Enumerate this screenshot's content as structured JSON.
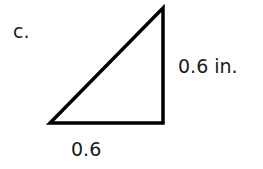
{
  "problem": {
    "label": "c."
  },
  "triangle": {
    "type": "right-triangle",
    "vertices": {
      "bottom_left": [
        50,
        123
      ],
      "bottom_right": [
        163,
        123
      ],
      "top_right": [
        163,
        8
      ]
    },
    "stroke_color": "#000000",
    "fill_color": "#ffffff"
  },
  "labels": {
    "vertical_side": "0.6 in.",
    "bottom_side": "0.6"
  }
}
